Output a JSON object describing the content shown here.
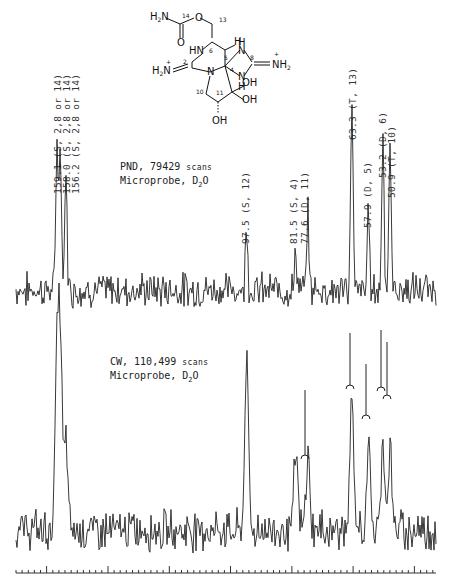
{
  "structure": {
    "name": "saxitoxin hydrate (carbon-numbered structure)",
    "atom_labels": [
      "H2N",
      "14",
      "O",
      "13",
      "HN",
      "6",
      "H",
      "5",
      "4",
      "H",
      "N",
      "8",
      "NH2+",
      "2",
      "H2N+",
      "N",
      "10",
      "11",
      "OH",
      "OH",
      "OH",
      "H",
      "N",
      "O"
    ]
  },
  "spectrum_top": {
    "caption_line1_main": "PND, 79429",
    "caption_line1_sc": "scans",
    "caption_line2_main": "Microprobe, D",
    "caption_line2_sub": "2",
    "caption_line2_end": "O",
    "peak_labels": [
      {
        "text": "159.1  (S, 2,8 or 14)",
        "x": 57
      },
      {
        "text": "158.0  (S, 2,8 or 14)",
        "x": 66
      },
      {
        "text": "156.2  (S, 2,8 or 14)",
        "x": 75
      },
      {
        "text": "97.5  (S, 12)",
        "x": 245
      },
      {
        "text": "81.5  (S, 4)",
        "x": 293
      },
      {
        "text": "77.6  (D, 11)",
        "x": 304
      },
      {
        "text": "63.3  (T, 13)",
        "x": 352
      },
      {
        "text": "57.9  (D, 5)",
        "x": 367
      },
      {
        "text": "53.2  (D, 6)",
        "x": 382
      },
      {
        "text": "50.9  (T, 10)",
        "x": 390
      }
    ]
  },
  "spectrum_bottom": {
    "caption_line1_main": "CW, 110,499",
    "caption_line1_sc": "scans",
    "caption_line2_main": "Microprobe, D",
    "caption_line2_sub": "2",
    "caption_line2_end": "O"
  },
  "chart_data": [
    {
      "type": "line",
      "title": "13C NMR spectrum — PND, 79429 scans, Microprobe, D2O",
      "xlabel": "chemical shift (ppm, decreasing left to right)",
      "ylabel": "intensity",
      "grid": false,
      "peaks": [
        {
          "ppm": 159.1,
          "multiplicity": "S",
          "assignment": "2,8 or 14",
          "rel_height": 0.78
        },
        {
          "ppm": 158.0,
          "multiplicity": "S",
          "assignment": "2,8 or 14",
          "rel_height": 0.72
        },
        {
          "ppm": 156.2,
          "multiplicity": "S",
          "assignment": "2,8 or 14",
          "rel_height": 0.6
        },
        {
          "ppm": 97.5,
          "multiplicity": "S",
          "assignment": "12",
          "rel_height": 0.35
        },
        {
          "ppm": 81.5,
          "multiplicity": "S",
          "assignment": "4",
          "rel_height": 0.2
        },
        {
          "ppm": 77.6,
          "multiplicity": "D",
          "assignment": "11",
          "rel_height": 0.37
        },
        {
          "ppm": 63.3,
          "multiplicity": "T",
          "assignment": "13",
          "rel_height": 1.0
        },
        {
          "ppm": 57.9,
          "multiplicity": "D",
          "assignment": "5",
          "rel_height": 0.4
        },
        {
          "ppm": 53.2,
          "multiplicity": "D",
          "assignment": "6",
          "rel_height": 0.82
        },
        {
          "ppm": 50.9,
          "multiplicity": "T",
          "assignment": "10",
          "rel_height": 0.7
        }
      ]
    },
    {
      "type": "line",
      "title": "13C NMR spectrum — CW, 110,499 scans, Microprobe, D2O",
      "xlabel": "chemical shift (ppm)",
      "ylabel": "intensity",
      "grid": false,
      "notes": "off-resonance/coupled spectrum; peaks at ~63, ~58, ~53, ~51 ppm drawn truncated with bracket markers; ~77.6 ppm also bracketed",
      "axis_ticks": {
        "major_count": 7,
        "minor_per_major": 10
      }
    }
  ]
}
